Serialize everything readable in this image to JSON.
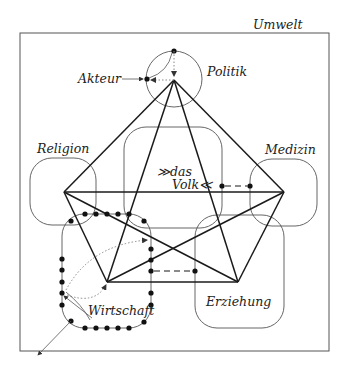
{
  "diagram": {
    "environment_label": "Umwelt",
    "actor_label": "Akteur",
    "systems": {
      "politik": "Politik",
      "religion": "Religion",
      "medizin": "Medizin",
      "volk_line1": "≫das",
      "volk_line2": "Volk≪",
      "erziehung": "Erziehung",
      "wirtschaft": "Wirtschaft"
    }
  }
}
